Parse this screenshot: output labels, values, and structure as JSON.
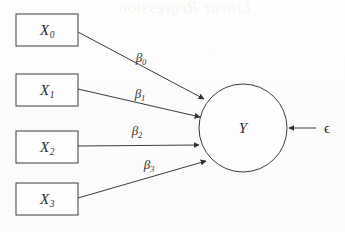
{
  "diagram": {
    "background_color": "#fdfdfc",
    "stroke_color": "#3a3a3a",
    "predictors": [
      {
        "id": "x0",
        "label": "X",
        "subscript": "0",
        "shape": "rectangle",
        "x": 16,
        "y": 14,
        "width": 62,
        "height": 32
      },
      {
        "id": "x1",
        "label": "X",
        "subscript": "1",
        "shape": "rectangle",
        "x": 16,
        "y": 74,
        "width": 62,
        "height": 32
      },
      {
        "id": "x2",
        "label": "X",
        "subscript": "2",
        "shape": "rectangle",
        "x": 16,
        "y": 131,
        "width": 62,
        "height": 32
      },
      {
        "id": "x3",
        "label": "X",
        "subscript": "3",
        "shape": "rectangle",
        "x": 16,
        "y": 183,
        "width": 62,
        "height": 32
      }
    ],
    "outcome": {
      "id": "y",
      "label": "Y",
      "shape": "circle",
      "cx": 243,
      "cy": 128,
      "r": 44
    },
    "paths": [
      {
        "id": "b0",
        "from": "x0",
        "to": "y",
        "label": "β",
        "subscript": "0",
        "x1": 78,
        "y1": 32,
        "x2": 204,
        "y2": 99,
        "label_x": 141,
        "label_y": 57
      },
      {
        "id": "b1",
        "from": "x1",
        "to": "y",
        "label": "β",
        "subscript": "1",
        "x1": 78,
        "y1": 89,
        "x2": 200,
        "y2": 117,
        "label_x": 140,
        "label_y": 93
      },
      {
        "id": "b2",
        "from": "x2",
        "to": "y",
        "label": "β",
        "subscript": "2",
        "x1": 78,
        "y1": 146,
        "x2": 199,
        "y2": 145,
        "label_x": 137,
        "label_y": 130
      },
      {
        "id": "b3",
        "from": "x3",
        "to": "y",
        "label": "β",
        "subscript": "3",
        "x1": 78,
        "y1": 198,
        "x2": 206,
        "y2": 161,
        "label_x": 149,
        "label_y": 164
      }
    ],
    "error_term": {
      "id": "epsilon",
      "label": "ϵ",
      "label_x": 327,
      "label_y": 128,
      "x1": 316,
      "y1": 128,
      "x2": 289,
      "y2": 128
    },
    "watermark_text": "Linear Regression"
  }
}
